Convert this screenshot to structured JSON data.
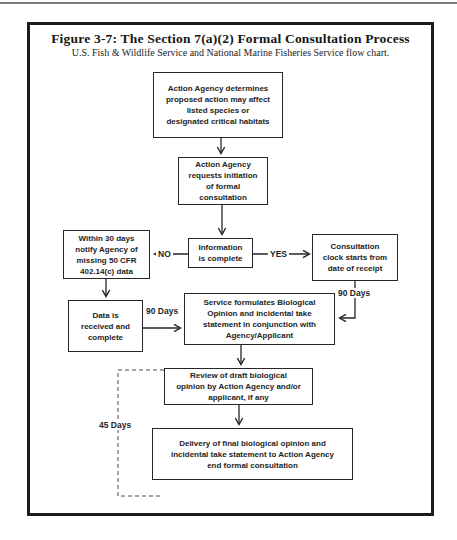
{
  "page": {
    "title": "Figure 3-7: The Section 7(a)(2) Formal Consultation Process",
    "subtitle": "U.S. Fish & Wildlife Service and National Marine Fisheries Service flow chart."
  },
  "flowchart": {
    "nodes": [
      {
        "id": "determine",
        "text": "Action Agency determines\nproposed action may affect\nlisted species or\ndesignated critical habitats"
      },
      {
        "id": "request",
        "text": "Action Agency\nrequests initiation\nof formal\nconsultation"
      },
      {
        "id": "notify",
        "text": "Within 30 days\nnotify Agency of\nmissing 50 CFR\n402.14(c) data"
      },
      {
        "id": "info-complete",
        "text": "Information\nis complete"
      },
      {
        "id": "clock",
        "text": "Consultation\nclock starts from\ndate of receipt"
      },
      {
        "id": "data-received",
        "text": "Data is\nreceived and\ncomplete"
      },
      {
        "id": "service-formulates",
        "text": "Service formulates Biological\nOpinion and incidental take\nstatement in conjunction with\nAgency/Applicant"
      },
      {
        "id": "review-draft",
        "text": "Review of draft biological\nopinion by Action Agency and/or\napplicant, if any"
      },
      {
        "id": "delivery-final",
        "text": "Delivery of final biological opinion and\nincidental  take statement to Action Agency\nend formal consultation"
      }
    ],
    "labels": {
      "no": "NO",
      "yes": "YES",
      "days_90_right": "90 Days",
      "days_90_left": "90 Days",
      "days_45": "45 Days"
    },
    "colors": {
      "ink": "#242424",
      "frame": "#1b1b1b",
      "background": "#ffffff"
    }
  }
}
